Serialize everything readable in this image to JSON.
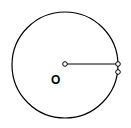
{
  "diagram": {
    "type": "geometry-circle",
    "circle": {
      "cx": 65,
      "cy": 65,
      "r": 53
    },
    "center_point": {
      "x": 65,
      "y": 64
    },
    "radius_line": {
      "x1": 65,
      "y1": 64,
      "x2": 118,
      "y2": 64
    },
    "points": [
      {
        "x": 118,
        "y": 64
      },
      {
        "x": 118,
        "y": 72
      }
    ],
    "labels": [
      {
        "text": "O",
        "x": 55,
        "y": 84
      }
    ],
    "stroke_color": "#000000",
    "background": "#ffffff"
  }
}
